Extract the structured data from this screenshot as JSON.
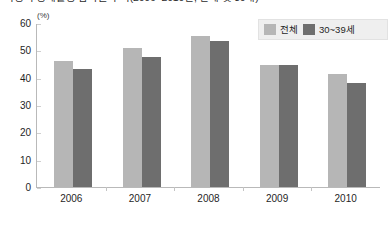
{
  "clipped_caption": "여성의 경제활동 참가율 추이(2006~2010년, 전체 및 30대)",
  "legend": {
    "entries": [
      {
        "label": "전체",
        "color": "#b6b6b6",
        "icon": "legend-swatch-icon"
      },
      {
        "label": "30~39세",
        "color": "#6e6e6e",
        "icon": "legend-swatch-icon"
      }
    ]
  },
  "chart_data": {
    "type": "bar",
    "title": "",
    "subtitle": "",
    "xlabel": "",
    "ylabel": "(%)",
    "unit": "(%)",
    "ylim": [
      0,
      60
    ],
    "ytick_step": 10,
    "yticks": [
      0,
      10,
      20,
      30,
      40,
      50,
      60
    ],
    "ytick_labels": [
      "0",
      "10",
      "20",
      "30",
      "40",
      "50",
      "60"
    ],
    "grid": false,
    "legend_position": "top-right",
    "categories": [
      "2006",
      "2007",
      "2008",
      "2009",
      "2010"
    ],
    "series": [
      {
        "name": "전체",
        "color": "#b6b6b6",
        "values": [
          46.2,
          51.0,
          55.2,
          44.5,
          41.2
        ]
      },
      {
        "name": "30~39세",
        "color": "#6e6e6e",
        "values": [
          43.0,
          47.4,
          53.4,
          44.5,
          38.0
        ]
      }
    ]
  }
}
